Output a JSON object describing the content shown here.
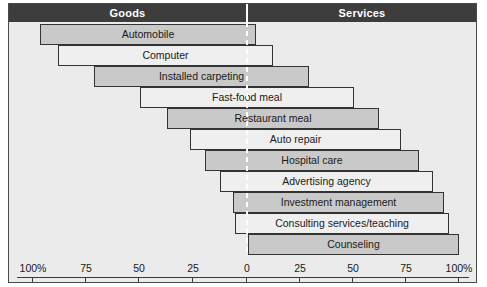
{
  "header": {
    "left_label": "Goods",
    "right_label": "Services"
  },
  "chart_data": {
    "type": "bar",
    "title": "",
    "subtitle": "",
    "xlabel": "",
    "ylabel": "",
    "orientation": "horizontal",
    "axis": {
      "center_value": 0,
      "left_side_label": "Goods",
      "right_side_label": "Services",
      "tick_labels": [
        "100%",
        "75",
        "50",
        "25",
        "0",
        "25",
        "50",
        "75",
        "100%"
      ],
      "tick_values": [
        -100,
        -75,
        -50,
        -25,
        0,
        25,
        50,
        75,
        100
      ],
      "range": [
        -100,
        100
      ],
      "grid": false,
      "legend": "none"
    },
    "categories": [
      "Automobile",
      "Computer",
      "Installed carpeting",
      "Fast-food meal",
      "Restaurant meal",
      "Auto repair",
      "Hospital care",
      "Advertising agency",
      "Investment management",
      "Consulting services/teaching",
      "Counseling"
    ],
    "bars": [
      {
        "label": "Automobile",
        "goods_pct": 97,
        "services_pct": 4,
        "fill": "shaded"
      },
      {
        "label": "Computer",
        "goods_pct": 88,
        "services_pct": 12,
        "fill": "plain"
      },
      {
        "label": "Installed carpeting",
        "goods_pct": 71,
        "services_pct": 29,
        "fill": "shaded"
      },
      {
        "label": "Fast-food meal",
        "goods_pct": 50,
        "services_pct": 50,
        "fill": "plain"
      },
      {
        "label": "Restaurant meal",
        "goods_pct": 37,
        "services_pct": 62,
        "fill": "shaded"
      },
      {
        "label": "Auto repair",
        "goods_pct": 26,
        "services_pct": 73,
        "fill": "plain"
      },
      {
        "label": "Hospital care",
        "goods_pct": 19,
        "services_pct": 81,
        "fill": "shaded"
      },
      {
        "label": "Advertising agency",
        "goods_pct": 12,
        "services_pct": 88,
        "fill": "plain"
      },
      {
        "label": "Investment management",
        "goods_pct": 7,
        "services_pct": 93,
        "fill": "shaded"
      },
      {
        "label": "Consulting services/teaching",
        "goods_pct": 4,
        "services_pct": 95,
        "fill": "plain"
      },
      {
        "label": "Counseling",
        "goods_pct": 0,
        "services_pct": 100,
        "fill": "shaded"
      }
    ]
  },
  "geometry": {
    "bar_px": [
      {
        "left": 31,
        "right": 247,
        "top": 2
      },
      {
        "left": 49,
        "right": 264,
        "top": 23
      },
      {
        "left": 85,
        "right": 300,
        "top": 44
      },
      {
        "left": 131,
        "right": 345,
        "top": 65
      },
      {
        "left": 158,
        "right": 370,
        "top": 86
      },
      {
        "left": 181,
        "right": 392,
        "top": 107
      },
      {
        "left": 196,
        "right": 410,
        "top": 128
      },
      {
        "left": 211,
        "right": 424,
        "top": 149
      },
      {
        "left": 224,
        "right": 435,
        "top": 170
      },
      {
        "left": 226,
        "right": 440,
        "top": 191
      },
      {
        "left": 239,
        "right": 450,
        "top": 212
      }
    ],
    "tick_px": [
      23,
      76,
      129,
      183,
      237,
      290,
      343,
      396,
      449
    ]
  }
}
